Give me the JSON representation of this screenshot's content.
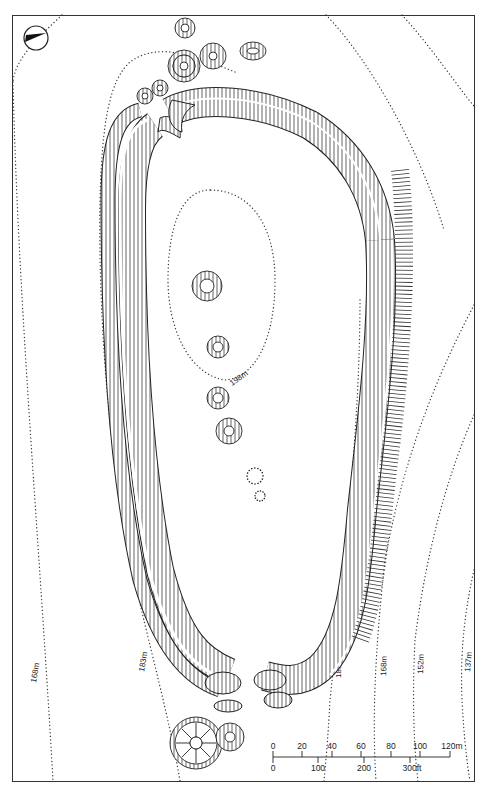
{
  "map": {
    "type": "archaeological site plan (hillfort with barrows)",
    "north_arrow": {
      "icon": "north-arrow-icon"
    },
    "contours": [
      {
        "label": "198m",
        "position": "summit oval"
      },
      {
        "label": "183m",
        "position": "west"
      },
      {
        "label": "183m",
        "position": "east"
      },
      {
        "label": "168m",
        "position": "west"
      },
      {
        "label": "168m",
        "position": "east"
      },
      {
        "label": "152m",
        "position": "east"
      },
      {
        "label": "137m",
        "position": "east"
      }
    ],
    "scale_bar": {
      "metric_ticks": [
        "0",
        "20",
        "40",
        "60",
        "80",
        "100",
        "120m"
      ],
      "imperial_ticks": [
        "0",
        "100",
        "200",
        "300ft"
      ]
    }
  }
}
